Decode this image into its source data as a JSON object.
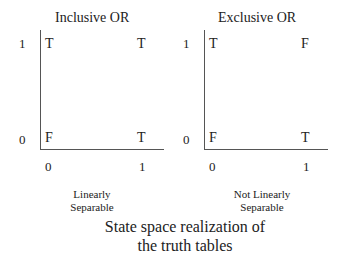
{
  "panels": [
    {
      "title": "Inclusive OR",
      "y_ticks": [
        "1",
        "0"
      ],
      "x_ticks": [
        "0",
        "1"
      ],
      "cells": {
        "top_left": "T",
        "top_right": "T",
        "bottom_left": "F",
        "bottom_right": "T"
      },
      "note": [
        "Linearly",
        "Separable"
      ]
    },
    {
      "title": "Exclusive OR",
      "y_ticks": [
        "1",
        "0"
      ],
      "x_ticks": [
        "0",
        "1"
      ],
      "cells": {
        "top_left": "T",
        "top_right": "F",
        "bottom_left": "F",
        "bottom_right": "T"
      },
      "note": [
        "Not Linearly",
        "Separable"
      ]
    }
  ],
  "caption": [
    "State space realization of",
    "the truth tables"
  ]
}
